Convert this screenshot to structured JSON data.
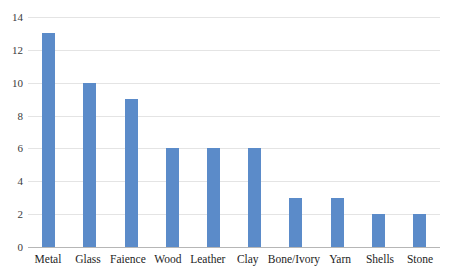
{
  "chart_data": {
    "type": "bar",
    "title": "",
    "subtitle": "",
    "xlabel": "",
    "ylabel": "",
    "categories": [
      "Metal",
      "Glass",
      "Faience",
      "Wood",
      "Leather",
      "Clay",
      "Bone/Ivory",
      "Yarn",
      "Shells",
      "Stone"
    ],
    "values": [
      13,
      10,
      9,
      6,
      6,
      6,
      3,
      3,
      2,
      2
    ],
    "ylim": [
      0,
      14
    ],
    "ytick_labels": [
      "14",
      "12",
      "10",
      "8",
      "6",
      "4",
      "2",
      "0"
    ],
    "ytick_values": [
      14,
      12,
      10,
      8,
      6,
      4,
      2,
      0
    ],
    "grid": "horizontal",
    "legend": "none",
    "bar_color": "#5b8bc9",
    "gridline_color": "#e4e4e4",
    "axis_color": "#b6b6b6",
    "background_color": "#ffffff"
  }
}
